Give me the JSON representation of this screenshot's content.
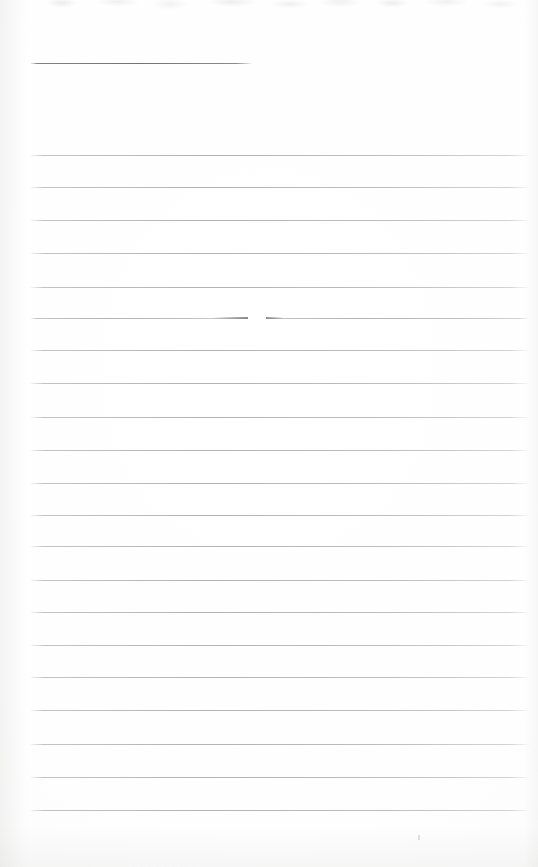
{
  "document": {
    "kind": "scanned-ruled-notebook-page",
    "page_label": "",
    "body_text": "",
    "background_color": "#fdfdfd",
    "rule_color": "#9a9a9e",
    "heading_rule_color": "#6a6a6e",
    "width": 538,
    "height": 867
  },
  "heading_rule": {
    "name": "heading-rule",
    "x": 31,
    "y": 63,
    "width": 221,
    "thickness": 1
  },
  "rules": [
    {
      "id": "rule-1",
      "y": 155,
      "x": 31,
      "width": 498,
      "broken": false
    },
    {
      "id": "rule-2",
      "y": 187,
      "x": 31,
      "width": 498,
      "broken": false
    },
    {
      "id": "rule-3",
      "y": 220,
      "x": 31,
      "width": 498,
      "broken": false
    },
    {
      "id": "rule-4",
      "y": 253,
      "x": 31,
      "width": 498,
      "broken": false
    },
    {
      "id": "rule-5",
      "y": 287,
      "x": 31,
      "width": 498,
      "broken": false
    },
    {
      "id": "rule-6",
      "y": 318,
      "x": 31,
      "width": 498,
      "broken": true,
      "gap_start": 248,
      "gap_end": 266
    },
    {
      "id": "rule-7",
      "y": 350,
      "x": 31,
      "width": 498,
      "broken": false
    },
    {
      "id": "rule-8",
      "y": 383,
      "x": 31,
      "width": 498,
      "broken": false
    },
    {
      "id": "rule-9",
      "y": 417,
      "x": 31,
      "width": 498,
      "broken": false
    },
    {
      "id": "rule-10",
      "y": 450,
      "x": 31,
      "width": 498,
      "broken": false
    },
    {
      "id": "rule-11",
      "y": 483,
      "x": 31,
      "width": 498,
      "broken": false
    },
    {
      "id": "rule-12",
      "y": 515,
      "x": 31,
      "width": 498,
      "broken": false
    },
    {
      "id": "rule-13",
      "y": 546,
      "x": 31,
      "width": 498,
      "broken": false
    },
    {
      "id": "rule-14",
      "y": 580,
      "x": 31,
      "width": 498,
      "broken": false
    },
    {
      "id": "rule-15",
      "y": 612,
      "x": 31,
      "width": 498,
      "broken": false
    },
    {
      "id": "rule-16",
      "y": 645,
      "x": 31,
      "width": 498,
      "broken": false
    },
    {
      "id": "rule-17",
      "y": 677,
      "x": 31,
      "width": 498,
      "broken": false
    },
    {
      "id": "rule-18",
      "y": 710,
      "x": 31,
      "width": 498,
      "broken": false
    },
    {
      "id": "rule-19",
      "y": 744,
      "x": 31,
      "width": 498,
      "broken": false
    },
    {
      "id": "rule-20",
      "y": 777,
      "x": 31,
      "width": 498,
      "broken": false
    },
    {
      "id": "rule-21",
      "y": 810,
      "x": 31,
      "width": 498,
      "broken": false
    }
  ],
  "marks": [
    {
      "id": "speck-1",
      "x": 418,
      "y": 835,
      "width": 2,
      "height": 5
    }
  ]
}
